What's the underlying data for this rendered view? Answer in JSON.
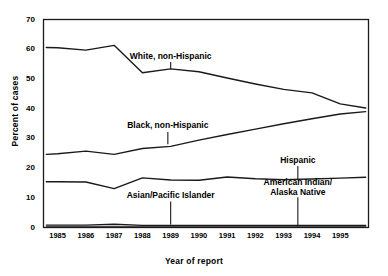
{
  "chart_data": {
    "type": "line",
    "title": "",
    "xlabel": "Year of report",
    "ylabel": "Percent of cases",
    "xlim": [
      1984.5,
      1996.0
    ],
    "ylim": [
      0,
      70
    ],
    "yticks": [
      0,
      10,
      20,
      30,
      40,
      50,
      60,
      70
    ],
    "xticks": [
      1985,
      1986,
      1987,
      1988,
      1989,
      1990,
      1991,
      1992,
      1993,
      1994,
      1995
    ],
    "grid": false,
    "legend": "inline-annotations",
    "x": [
      1984.6,
      1985,
      1986,
      1987,
      1988,
      1989,
      1990,
      1991,
      1992,
      1993,
      1994,
      1995,
      1995.9
    ],
    "series": [
      {
        "name": "White, non-Hispanic",
        "values": [
          60.6,
          60.5,
          59.7,
          61.3,
          52.1,
          53.4,
          52.4,
          50.3,
          48.3,
          46.5,
          45.3,
          41.6,
          40.2
        ]
      },
      {
        "name": "Black, non-Hispanic",
        "values": [
          24.6,
          24.8,
          25.7,
          24.6,
          26.6,
          27.3,
          29.4,
          31.3,
          33.1,
          34.9,
          36.6,
          38.2,
          39.0
        ]
      },
      {
        "name": "Hispanic",
        "values": [
          15.4,
          15.4,
          15.3,
          13.1,
          16.7,
          16.0,
          15.9,
          17.0,
          16.4,
          16.1,
          16.3,
          16.6,
          16.9
        ]
      },
      {
        "name": "Asian/Pacific Islander",
        "values": [
          0.8,
          0.8,
          0.8,
          1.1,
          0.7,
          0.7,
          0.7,
          0.7,
          0.7,
          0.7,
          0.7,
          0.7,
          0.7
        ]
      },
      {
        "name": "American Indian/Alaska Native",
        "values": [
          0.2,
          0.2,
          0.2,
          0.2,
          0.2,
          0.2,
          0.2,
          0.2,
          0.2,
          0.2,
          0.2,
          0.2,
          0.2
        ]
      }
    ],
    "annotations": [
      {
        "text": "White, non-Hispanic",
        "x": 1989.0,
        "label_y": 56.5,
        "target_y": 53.4
      },
      {
        "text": "Black, non-Hispanic",
        "x": 1988.9,
        "label_y": 33.0,
        "target_y": 28.0
      },
      {
        "text": "Hispanic",
        "x": 1993.5,
        "label_y": 21.5,
        "target_y": 16.2
      },
      {
        "text": "Asian/Pacific Islander",
        "x": 1989.0,
        "label_y": 9.6,
        "target_y": 1.0
      },
      {
        "text": "American Indian/​Alaska Native",
        "x": 1993.5,
        "label_y": 11.0,
        "target_y": 0.4
      }
    ]
  },
  "annotation_labels": {
    "white": "White, non-Hispanic",
    "black": "Black, non-Hispanic",
    "hispanic": "Hispanic",
    "asian": "Asian/Pacific Islander",
    "amind_line1": "American Indian/",
    "amind_line2": "Alaska Native"
  },
  "axis": {
    "y_title": "Percent of cases",
    "x_title": "Year of report",
    "y_tick_labels": [
      "0",
      "10",
      "20",
      "30",
      "40",
      "50",
      "60",
      "70"
    ],
    "x_tick_labels": [
      "1985",
      "1986",
      "1987",
      "1988",
      "1989",
      "1990",
      "1991",
      "1992",
      "1993",
      "1994",
      "1995"
    ]
  },
  "style": {
    "line_color": "#1a1a1a",
    "frame_color": "#1a1a1a",
    "background": "#ffffff"
  }
}
